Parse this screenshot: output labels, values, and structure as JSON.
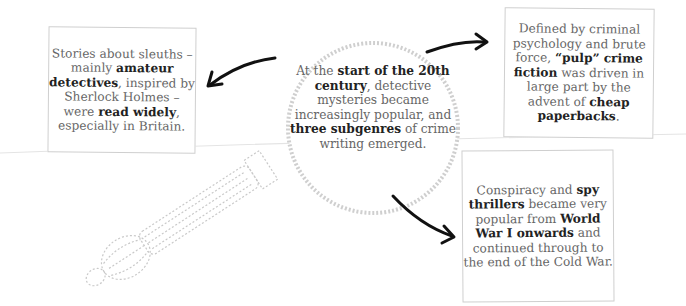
{
  "center": {
    "segments": [
      {
        "t": "At the ",
        "b": false
      },
      {
        "t": "start of the 20th century",
        "b": true
      },
      {
        "t": ", detective mysteries became increasingly popular, and ",
        "b": false
      },
      {
        "t": "three subgenres",
        "b": true
      },
      {
        "t": " of crime writing emerged.",
        "b": false
      }
    ]
  },
  "boxes": [
    {
      "id": "sleuths",
      "segments": [
        {
          "t": "Stories about sleuths – mainly ",
          "b": false
        },
        {
          "t": "amateur detectives",
          "b": true
        },
        {
          "t": ", inspired by Sherlock Holmes – were ",
          "b": false
        },
        {
          "t": "read widely",
          "b": true
        },
        {
          "t": ", especially in Britain.",
          "b": false
        }
      ]
    },
    {
      "id": "pulp",
      "segments": [
        {
          "t": "Defined by criminal psychology and brute force, ",
          "b": false
        },
        {
          "t": "“pulp” crime fiction",
          "b": true
        },
        {
          "t": " was driven in large part by the advent of ",
          "b": false
        },
        {
          "t": "cheap paperbacks",
          "b": true
        },
        {
          "t": ".",
          "b": false
        }
      ]
    },
    {
      "id": "spy",
      "segments": [
        {
          "t": "Conspiracy and ",
          "b": false
        },
        {
          "t": "spy thrillers",
          "b": true
        },
        {
          "t": " became very popular from ",
          "b": false
        },
        {
          "t": "World War I onwards",
          "b": true
        },
        {
          "t": " and continued through to the end of the Cold War.",
          "b": false
        }
      ]
    }
  ],
  "icons": {
    "illustration": "magnifying-glass-icon",
    "arrow": "curved-arrow-icon"
  },
  "colors": {
    "text": "#666666",
    "bold": "#222222",
    "border": "#cfcfcf",
    "arrow": "#111111",
    "glass": "#c8c8c8"
  }
}
